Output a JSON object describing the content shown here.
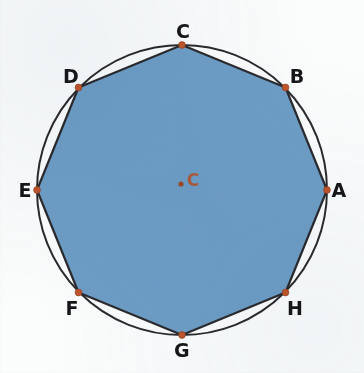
{
  "figure": {
    "background_color": "#fbfcfc",
    "canvas": {
      "width": 364,
      "height": 373
    }
  },
  "circle": {
    "name": "circumscribed-circle",
    "center_x": 182,
    "center_y": 190,
    "radius": 145,
    "stroke_color": "#2b2b2f",
    "stroke_width": 2.0,
    "fill": "none"
  },
  "polygon": {
    "name": "regular-octagon",
    "sides": 8,
    "fill_color": "#6d9dc5",
    "stroke_color": "#2b2b2f",
    "stroke_width": 2.2,
    "points": "327,190 285.5,87.5 182,45 78.5,87.5 37,190 78.5,292.5 182,335 285.5,292.5"
  },
  "center_point": {
    "name": "center-point",
    "x": 181,
    "y": 184,
    "radius": 2.6,
    "color": "#9c4a2a",
    "label": "C",
    "label_x": 193,
    "label_y": 180,
    "label_color": "#b4522c"
  },
  "vertices": [
    {
      "id": "A",
      "label": "A",
      "x": 327,
      "y": 190,
      "label_x": 339,
      "label_y": 190,
      "angle_deg": 0
    },
    {
      "id": "B",
      "label": "B",
      "x": 285.5,
      "y": 87.5,
      "label_x": 297,
      "label_y": 76,
      "angle_deg": 45
    },
    {
      "id": "C",
      "label": "C",
      "x": 182,
      "y": 45,
      "label_x": 183,
      "label_y": 31,
      "angle_deg": 90
    },
    {
      "id": "D",
      "label": "D",
      "x": 78.5,
      "y": 87.5,
      "label_x": 71,
      "label_y": 76,
      "angle_deg": 135
    },
    {
      "id": "E",
      "label": "E",
      "x": 37,
      "y": 190,
      "label_x": 25,
      "label_y": 190,
      "angle_deg": 180
    },
    {
      "id": "F",
      "label": "F",
      "x": 78.5,
      "y": 292.5,
      "label_x": 72,
      "label_y": 308,
      "angle_deg": 225
    },
    {
      "id": "G",
      "label": "G",
      "x": 182,
      "y": 335,
      "label_x": 182,
      "label_y": 350,
      "angle_deg": 270
    },
    {
      "id": "H",
      "label": "H",
      "x": 285.5,
      "y": 292.5,
      "label_x": 295,
      "label_y": 308,
      "angle_deg": 315
    }
  ],
  "vertex_marker": {
    "name": "vertex-dot",
    "radius": 3.4,
    "fill_color": "#c0562e",
    "stroke_color": "#8e3b1c"
  },
  "colors": {
    "polygon_fill": "#6d9dc5",
    "line": "#2b2b2f",
    "marker": "#c0562e",
    "center_text": "#b4522c",
    "label_text": "#16161a",
    "background": "#fbfcfc"
  },
  "bottom_cut_text": "............"
}
